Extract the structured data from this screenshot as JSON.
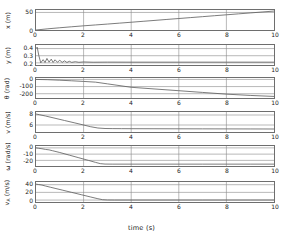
{
  "chart_data": {
    "type": "line",
    "title": "",
    "xlabel": "time (s)",
    "xlim": [
      0,
      10
    ],
    "xticks": [
      0,
      2,
      4,
      6,
      8,
      10
    ],
    "grid": true,
    "legend": "none",
    "panels": [
      {
        "name": "x-position",
        "ylabel": "x (m)",
        "ylabel_text": "x",
        "ylabel_unit": "(m)",
        "ylim": [
          0,
          57
        ],
        "yticks": [
          0,
          50
        ],
        "ytick_labels": [
          "0",
          "50"
        ],
        "x": [
          0,
          0.5,
          1,
          1.5,
          2,
          2.5,
          3,
          3.5,
          4,
          4.5,
          5,
          5.5,
          6,
          6.5,
          7,
          7.5,
          8,
          8.5,
          9,
          9.5,
          10
        ],
        "y": [
          0,
          3.4,
          6.4,
          9.2,
          11.9,
          14.4,
          16.9,
          19.5,
          22.1,
          24.8,
          27.4,
          30.1,
          32.7,
          35.4,
          38.0,
          40.7,
          43.3,
          46.0,
          48.6,
          51.3,
          54.0
        ]
      },
      {
        "name": "y-position",
        "ylabel": "y (m)",
        "ylabel_text": "y",
        "ylabel_unit": "(m)",
        "ylim": [
          0.17,
          0.45
        ],
        "yticks": [
          0.2,
          0.3,
          0.4
        ],
        "ytick_labels": [
          "0.2",
          "0.3",
          "0.4"
        ],
        "x": [
          0,
          0.05,
          0.12,
          0.2,
          0.3,
          0.38,
          0.46,
          0.55,
          0.64,
          0.72,
          0.8,
          0.9,
          1.0,
          1.1,
          1.2,
          1.3,
          1.4,
          1.5,
          1.65,
          1.8,
          2.0,
          2.4,
          3.0,
          4.0,
          6.0,
          8.0,
          10.0
        ],
        "y": [
          0.4,
          0.42,
          0.3,
          0.2,
          0.245,
          0.205,
          0.262,
          0.21,
          0.252,
          0.206,
          0.243,
          0.209,
          0.236,
          0.207,
          0.228,
          0.206,
          0.222,
          0.207,
          0.216,
          0.208,
          0.213,
          0.209,
          0.2105,
          0.21,
          0.21,
          0.21,
          0.21
        ]
      },
      {
        "name": "theta-angle",
        "ylabel": "θ (rad)",
        "ylabel_text": "θ",
        "ylabel_unit": "(rad)",
        "ylim": [
          -260,
          20
        ],
        "yticks": [
          0,
          -100,
          -200
        ],
        "ytick_labels": [
          "0",
          "-100",
          "-200"
        ],
        "x": [
          0,
          0.5,
          1,
          1.5,
          2,
          2.5,
          3,
          4,
          5,
          6,
          7,
          8,
          9,
          10
        ],
        "y": [
          0,
          -4,
          -11,
          -19,
          -28,
          -38,
          -62,
          -110,
          -134,
          -158,
          -182,
          -206,
          -224,
          -238
        ]
      },
      {
        "name": "speed-v",
        "ylabel": "v (m/s)",
        "ylabel_text": "v",
        "ylabel_unit": "(m/s)",
        "ylim": [
          4.6,
          8.6
        ],
        "yticks": [
          6,
          8
        ],
        "ytick_labels": [
          "6",
          "8"
        ],
        "x": [
          0,
          0.15,
          0.4,
          0.8,
          1.2,
          1.6,
          2.0,
          2.3,
          2.6,
          2.9,
          3.2,
          3.6,
          4.0,
          5.0,
          6.0,
          7.0,
          8.0,
          9.0,
          10.0
        ],
        "y": [
          8.2,
          8.05,
          7.8,
          7.35,
          6.9,
          6.45,
          6.0,
          5.65,
          5.4,
          5.3,
          5.28,
          5.27,
          5.26,
          5.25,
          5.24,
          5.23,
          5.22,
          5.21,
          5.2
        ]
      },
      {
        "name": "omega-angular-velocity",
        "ylabel": "ω (rad/s)",
        "ylabel_text": "ω",
        "ylabel_unit": "(rad/s)",
        "ylim": [
          -29,
          3
        ],
        "yticks": [
          0,
          -10,
          -20
        ],
        "ytick_labels": [
          "0",
          "-10",
          "-20"
        ],
        "x": [
          0,
          0.1,
          0.25,
          0.4,
          0.55,
          0.7,
          1.0,
          1.4,
          1.8,
          2.2,
          2.5,
          2.7,
          2.9,
          3.2,
          4.0,
          5.0,
          6.0,
          7.0,
          8.0,
          9.0,
          10.0
        ],
        "y": [
          0,
          -0.6,
          -1.4,
          -2.5,
          -3.2,
          -4.6,
          -7.4,
          -11.6,
          -15.8,
          -20.0,
          -23.2,
          -25.2,
          -25.9,
          -26.0,
          -26.0,
          -26.0,
          -26.0,
          -26.0,
          -26.0,
          -26.0,
          -26.0
        ]
      },
      {
        "name": "va-speed",
        "ylabel": "v_A (m/s)",
        "ylabel_text": "v",
        "ylabel_sub": "A",
        "ylabel_unit": "(m/s)",
        "ylim": [
          -5,
          47
        ],
        "yticks": [
          0,
          20,
          40
        ],
        "ytick_labels": [
          "0",
          "20",
          "40"
        ],
        "x": [
          0,
          0.1,
          0.25,
          0.4,
          0.6,
          0.8,
          1.1,
          1.5,
          1.9,
          2.3,
          2.6,
          2.8,
          3.0,
          3.3,
          4.0,
          5.0,
          6.0,
          7.0,
          8.0,
          9.0,
          10.0
        ],
        "y": [
          41.5,
          40.5,
          39.0,
          36.5,
          33.5,
          30.5,
          26.0,
          20.0,
          14.0,
          8.0,
          3.5,
          1.0,
          0.3,
          0.2,
          0.2,
          0.2,
          0.2,
          0.2,
          0.2,
          0.2,
          0.2
        ]
      }
    ]
  }
}
